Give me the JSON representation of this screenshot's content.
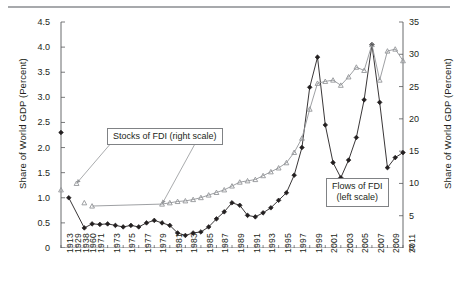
{
  "figure": {
    "left_axis_title": "Share of World GDP (Percent)",
    "right_axis_title": "Share of World GDP (Percent)",
    "callouts": {
      "stocks": "Stocks of FDI (right scale)",
      "flows_line1": "Flows of FDI",
      "flows_line2": "(left scale)"
    }
  },
  "chart_data": {
    "type": "line",
    "title": "",
    "xlabel": "",
    "ylabel": "Share of World GDP (Percent)",
    "ylim": [
      0,
      4.5
    ],
    "y2lim": [
      0,
      35
    ],
    "ylabel_right": "Share of World GDP (Percent)",
    "grid": false,
    "legend_position": "annotations",
    "y_ticks_left": [
      "0",
      "0.5",
      "1.0",
      "1.5",
      "2.0",
      "2.5",
      "3.0",
      "3.5",
      "4.0",
      "4.5"
    ],
    "y_ticks_right": [
      "0",
      "5",
      "10",
      "15",
      "20",
      "25",
      "30",
      "35"
    ],
    "categories": [
      "1913",
      "1929",
      "1938",
      "1960",
      "1971",
      "1973",
      "1975",
      "1977",
      "1979",
      "1981",
      "1983",
      "1985",
      "1987",
      "1989",
      "1991",
      "1993",
      "1995",
      "1997",
      "1999",
      "2001",
      "2003",
      "2005",
      "2007",
      "2009",
      "2011"
    ],
    "x_tick_labels": [
      "1913",
      "1929",
      "1938",
      "1960",
      "1971",
      "1973",
      "1975",
      "1977",
      "1979",
      "1981",
      "1983",
      "1985",
      "1987",
      "1989",
      "1991",
      "1993",
      "1995",
      "1997",
      "1999",
      "2001",
      "2003",
      "2005",
      "2007",
      "2009",
      "2011"
    ],
    "x_all_years": [
      "1913",
      "1929",
      "1938",
      "1960",
      "1971",
      "1972",
      "1973",
      "1974",
      "1975",
      "1976",
      "1977",
      "1978",
      "1979",
      "1980",
      "1981",
      "1982",
      "1983",
      "1984",
      "1985",
      "1986",
      "1987",
      "1988",
      "1989",
      "1990",
      "1991",
      "1992",
      "1993",
      "1994",
      "1995",
      "1996",
      "1997",
      "1998",
      "1999",
      "2000",
      "2001",
      "2002",
      "2003",
      "2004",
      "2005",
      "2006",
      "2007",
      "2008",
      "2009",
      "2010",
      "2011"
    ],
    "series": [
      {
        "name": "Flows of FDI (left scale)",
        "axis": "left",
        "marker": "filled-diamond",
        "color": "#231f20",
        "units": "percent of world GDP",
        "points": [
          {
            "x": "1913",
            "y": 2.3,
            "connected": false
          },
          {
            "x": "1929",
            "y": 1.0,
            "connected": false
          },
          {
            "x": "1960",
            "y": 0.4
          },
          {
            "x": "1971",
            "y": 0.48
          },
          {
            "x": "1972",
            "y": 0.47
          },
          {
            "x": "1973",
            "y": 0.48
          },
          {
            "x": "1974",
            "y": 0.45
          },
          {
            "x": "1975",
            "y": 0.42
          },
          {
            "x": "1976",
            "y": 0.45
          },
          {
            "x": "1977",
            "y": 0.42
          },
          {
            "x": "1978",
            "y": 0.5
          },
          {
            "x": "1979",
            "y": 0.55
          },
          {
            "x": "1980",
            "y": 0.5
          },
          {
            "x": "1981",
            "y": 0.45
          },
          {
            "x": "1982",
            "y": 0.3
          },
          {
            "x": "1983",
            "y": 0.25
          },
          {
            "x": "1984",
            "y": 0.3
          },
          {
            "x": "1985",
            "y": 0.32
          },
          {
            "x": "1986",
            "y": 0.42
          },
          {
            "x": "1987",
            "y": 0.58
          },
          {
            "x": "1988",
            "y": 0.72
          },
          {
            "x": "1989",
            "y": 0.9
          },
          {
            "x": "1990",
            "y": 0.85
          },
          {
            "x": "1991",
            "y": 0.65
          },
          {
            "x": "1992",
            "y": 0.62
          },
          {
            "x": "1993",
            "y": 0.7
          },
          {
            "x": "1994",
            "y": 0.8
          },
          {
            "x": "1995",
            "y": 0.95
          },
          {
            "x": "1996",
            "y": 1.1
          },
          {
            "x": "1997",
            "y": 1.45
          },
          {
            "x": "1998",
            "y": 2.0
          },
          {
            "x": "1999",
            "y": 3.2
          },
          {
            "x": "2000",
            "y": 3.8
          },
          {
            "x": "2001",
            "y": 2.45
          },
          {
            "x": "2002",
            "y": 1.7
          },
          {
            "x": "2003",
            "y": 1.4
          },
          {
            "x": "2004",
            "y": 1.75
          },
          {
            "x": "2005",
            "y": 2.2
          },
          {
            "x": "2006",
            "y": 2.95
          },
          {
            "x": "2007",
            "y": 4.05
          },
          {
            "x": "2008",
            "y": 2.9
          },
          {
            "x": "2009",
            "y": 1.6
          },
          {
            "x": "2010",
            "y": 1.8
          },
          {
            "x": "2011",
            "y": 1.9
          }
        ]
      },
      {
        "name": "Stocks of FDI (right scale)",
        "axis": "right",
        "marker": "open-triangle",
        "color": "#939598",
        "units": "percent of world GDP",
        "points": [
          {
            "x": "1913",
            "y": 9.0,
            "connected": false
          },
          {
            "x": "1938",
            "y": 10.0,
            "connected": false
          },
          {
            "x": "1960",
            "y": 7.0,
            "connected": false
          },
          {
            "x": "1971",
            "y": 6.5,
            "connected": false
          },
          {
            "x": "1980",
            "y": 6.8
          },
          {
            "x": "1981",
            "y": 7.0
          },
          {
            "x": "1982",
            "y": 7.2
          },
          {
            "x": "1983",
            "y": 7.3
          },
          {
            "x": "1984",
            "y": 7.5
          },
          {
            "x": "1985",
            "y": 7.8
          },
          {
            "x": "1986",
            "y": 8.2
          },
          {
            "x": "1987",
            "y": 8.6
          },
          {
            "x": "1988",
            "y": 9.0
          },
          {
            "x": "1989",
            "y": 9.6
          },
          {
            "x": "1990",
            "y": 10.2
          },
          {
            "x": "1991",
            "y": 10.4
          },
          {
            "x": "1992",
            "y": 10.6
          },
          {
            "x": "1993",
            "y": 11.2
          },
          {
            "x": "1994",
            "y": 11.8
          },
          {
            "x": "1995",
            "y": 12.4
          },
          {
            "x": "1996",
            "y": 13.2
          },
          {
            "x": "1997",
            "y": 14.8
          },
          {
            "x": "1998",
            "y": 17.0
          },
          {
            "x": "1999",
            "y": 21.5
          },
          {
            "x": "2000",
            "y": 25.5
          },
          {
            "x": "2001",
            "y": 25.8
          },
          {
            "x": "2002",
            "y": 26.0
          },
          {
            "x": "2003",
            "y": 25.2
          },
          {
            "x": "2004",
            "y": 26.5
          },
          {
            "x": "2005",
            "y": 28.0
          },
          {
            "x": "2006",
            "y": 27.5
          },
          {
            "x": "2007",
            "y": 31.5
          },
          {
            "x": "2008",
            "y": 26.0
          },
          {
            "x": "2009",
            "y": 30.5
          },
          {
            "x": "2010",
            "y": 30.8
          },
          {
            "x": "2011",
            "y": 29.0
          }
        ]
      }
    ],
    "annotations": [
      {
        "text": "Stocks of FDI (right scale)",
        "points_to": [
          "1938",
          "1980"
        ]
      },
      {
        "text": "Flows of FDI (left scale)",
        "points_to": []
      }
    ]
  }
}
